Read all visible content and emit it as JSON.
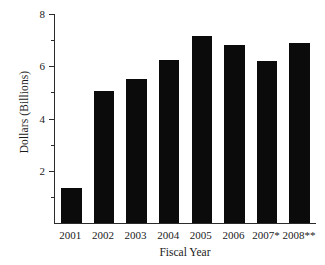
{
  "chart_data": {
    "type": "bar",
    "title": "",
    "xlabel": "Fiscal Year",
    "ylabel": "Dollars (Billions)",
    "categories": [
      "2001",
      "2002",
      "2003",
      "2004",
      "2005",
      "2006",
      "2007*",
      "2008**"
    ],
    "values": [
      1.35,
      5.05,
      5.5,
      6.25,
      7.15,
      6.8,
      6.2,
      6.9
    ],
    "ylim": [
      0,
      8
    ],
    "y_major_ticks": [
      2,
      4,
      6,
      8
    ],
    "y_minor_ticks": [
      1,
      3,
      5,
      7
    ],
    "y_tick_labels": [
      "2",
      "4",
      "6",
      "8"
    ],
    "grid": false,
    "legend": "none",
    "bar_color": "#0b0b0b",
    "axis_color": "#2b2b2b",
    "background_color": "#ffffff"
  },
  "axes": {
    "y_title": "Dollars (Billions)",
    "x_title": "Fiscal Year"
  }
}
